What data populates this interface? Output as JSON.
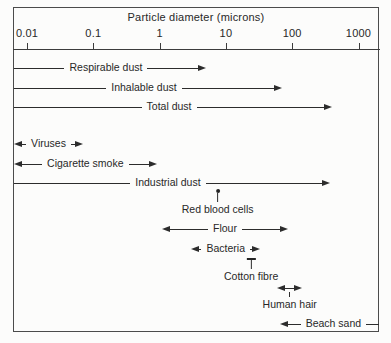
{
  "chart_data": {
    "type": "bar",
    "subtype": "horizontal-log-range-spans",
    "title": "Particle diameter (microns)",
    "x_axis": {
      "scale": "log",
      "unit": "microns",
      "range": [
        0.01,
        1000
      ],
      "ticks": [
        0.01,
        0.1,
        1,
        10,
        100,
        1000
      ],
      "tick_labels": [
        "0.01",
        "0.1",
        "1",
        "10",
        "100",
        "1000"
      ],
      "grid": false
    },
    "series": [
      {
        "name": "Respirable dust",
        "type": "range",
        "min": null,
        "min_unbounded": true,
        "max": 5,
        "max_unbounded": false,
        "arrows": "right",
        "label_placement": "inline",
        "y_px": 68
      },
      {
        "name": "Inhalable dust",
        "type": "range",
        "min": null,
        "min_unbounded": true,
        "max": 70,
        "max_unbounded": false,
        "arrows": "right",
        "label_placement": "inline",
        "y_px": 88
      },
      {
        "name": "Total dust",
        "type": "range",
        "min": null,
        "min_unbounded": true,
        "max": 400,
        "max_unbounded": false,
        "arrows": "right",
        "label_placement": "inline",
        "y_px": 107
      },
      {
        "name": "Viruses",
        "type": "range",
        "min": null,
        "min_unbounded": true,
        "max": 0.07,
        "max_unbounded": false,
        "arrows": "both",
        "label_placement": "inline",
        "y_px": 144
      },
      {
        "name": "Cigarette smoke",
        "type": "range",
        "min": null,
        "min_unbounded": true,
        "max": 0.9,
        "max_unbounded": false,
        "arrows": "both",
        "label_placement": "inline",
        "y_px": 164
      },
      {
        "name": "Industrial dust",
        "type": "range",
        "min": null,
        "min_unbounded": true,
        "max": 370,
        "max_unbounded": false,
        "arrows": "right",
        "label_placement": "inline",
        "y_px": 183
      },
      {
        "name": "Red blood cells",
        "type": "point",
        "value": 7.5,
        "label_placement": "below",
        "y_px": 189
      },
      {
        "name": "Flour",
        "type": "range",
        "min": 1.1,
        "min_unbounded": false,
        "max": 85,
        "max_unbounded": false,
        "arrows": "both",
        "label_placement": "inline",
        "y_px": 229
      },
      {
        "name": "Bacteria",
        "type": "range",
        "min": 3,
        "min_unbounded": false,
        "max": 33,
        "max_unbounded": false,
        "arrows": "both",
        "label_placement": "inline",
        "y_px": 249
      },
      {
        "name": "Cotton fibre",
        "type": "tick",
        "value": 24,
        "label_placement": "below",
        "y_px": 258
      },
      {
        "name": "Human hair",
        "type": "range",
        "min": 60,
        "min_unbounded": false,
        "max": 140,
        "max_unbounded": false,
        "arrows": "both",
        "label_placement": "below",
        "y_px": 288
      },
      {
        "name": "Beach sand",
        "type": "range",
        "min": 65,
        "min_unbounded": false,
        "max": null,
        "max_unbounded": true,
        "arrows": "left",
        "label_placement": "inline",
        "y_px": 324
      }
    ]
  }
}
